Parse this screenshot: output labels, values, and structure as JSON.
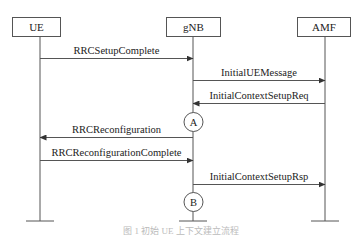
{
  "diagram": {
    "type": "sequence",
    "entities": [
      {
        "id": "ue",
        "label": "UE",
        "x": 40,
        "box": [
          12,
          17,
          48,
          19
        ]
      },
      {
        "id": "gnb",
        "label": "gNB",
        "x": 193,
        "box": [
          166,
          17,
          54,
          19
        ]
      },
      {
        "id": "amf",
        "label": "AMF",
        "x": 325,
        "box": [
          297,
          17,
          53,
          19
        ]
      }
    ],
    "messages": [
      {
        "label": "RRCSetupComplete",
        "from": "ue",
        "to": "gnb",
        "y": 58
      },
      {
        "label": "InitialUEMessage",
        "from": "gnb",
        "to": "amf",
        "y": 80
      },
      {
        "label": "InitialContextSetupReq",
        "from": "amf",
        "to": "gnb",
        "y": 103
      },
      {
        "label": "RRCReconfiguration",
        "from": "gnb",
        "to": "ue",
        "y": 137
      },
      {
        "label": "RRCReconfigurationComplete",
        "from": "ue",
        "to": "gnb",
        "y": 160
      },
      {
        "label": "InitialContextSetupRsp",
        "from": "gnb",
        "to": "amf",
        "y": 184
      }
    ],
    "markers": [
      {
        "label": "A",
        "entity": "gnb",
        "y": 122
      },
      {
        "label": "B",
        "entity": "gnb",
        "y": 202
      }
    ],
    "lifeline_end_y": 221,
    "caption": "图 1  初始 UE 上下文建立流程"
  }
}
